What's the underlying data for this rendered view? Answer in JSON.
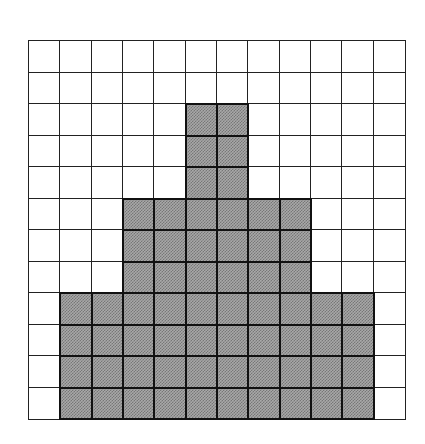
{
  "grid": {
    "rows": 12,
    "cols": 12,
    "fill_color": "#a8a8a8",
    "line_color": "#222222",
    "filled_regions": [
      {
        "name": "tower",
        "rows": [
          2,
          4
        ],
        "cols": [
          5,
          6
        ]
      },
      {
        "name": "middle-tier",
        "rows": [
          5,
          7
        ],
        "cols": [
          3,
          8
        ]
      },
      {
        "name": "base-tier",
        "rows": [
          8,
          11
        ],
        "cols": [
          1,
          10
        ]
      }
    ]
  }
}
